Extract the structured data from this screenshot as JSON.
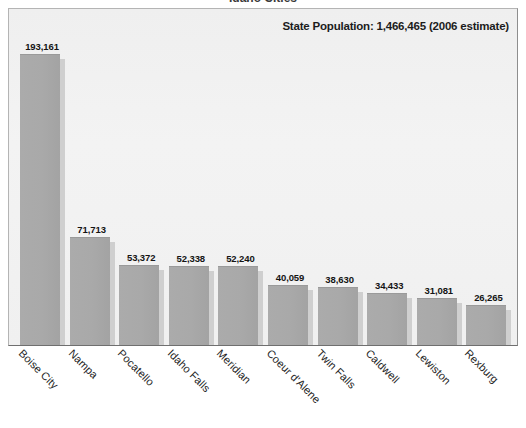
{
  "title_cropped": "Idaho Cities",
  "annotation": {
    "state_population_label": "State Population: 1,466,465 (2006 estimate)"
  },
  "chart_data": {
    "type": "bar",
    "title": "Idaho Cities",
    "xlabel": "",
    "ylabel": "",
    "ylim": [
      0,
      210000
    ],
    "grid": false,
    "legend": false,
    "annotations": [
      "State Population: 1,466,465 (2006 estimate)"
    ],
    "categories": [
      "Boise City",
      "Nampa",
      "Pocatello",
      "Idaho Falls",
      "Meridian",
      "Coeur d'Alene",
      "Twin Falls",
      "Caldwell",
      "Lewiston",
      "Rexburg"
    ],
    "values": [
      193161,
      71713,
      53372,
      52338,
      52240,
      40059,
      38630,
      34433,
      31081,
      26265
    ],
    "value_labels": [
      "193,161",
      "71,713",
      "53,372",
      "52,338",
      "52,240",
      "40,059",
      "38,630",
      "34,433",
      "31,081",
      "26,265"
    ]
  },
  "colors": {
    "bar_fill": "#a9a9a9",
    "bar_shadow": "#cfcfcf",
    "plot_background": "#f1f1f1",
    "frame_border": "#8e8e8e",
    "text": "#1c1c1c",
    "page_background": "#ffffff"
  }
}
